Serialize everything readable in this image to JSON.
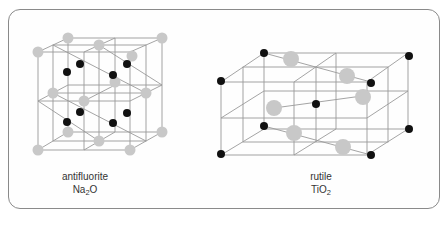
{
  "figure": {
    "panels": [
      {
        "id": "antifluorite",
        "structure_name": "antifluorite",
        "formula_main": "Na",
        "formula_sub": "2",
        "formula_tail": "O"
      },
      {
        "id": "rutile",
        "structure_name": "rutile",
        "formula_main": "TiO",
        "formula_sub": "2",
        "formula_tail": ""
      }
    ],
    "colors": {
      "frame": "#8a8a8a",
      "lattice_line": "#9a9a9a",
      "grey_atom": "#c8c8c8",
      "black_atom": "#111111"
    }
  }
}
